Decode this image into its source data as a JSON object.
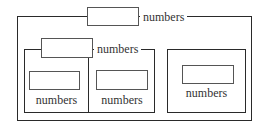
{
  "diagram": {
    "outer_group": {
      "label": "numbers"
    },
    "left_group": {
      "label": "numbers",
      "cells": [
        {
          "label": "numbers"
        },
        {
          "label": "numbers"
        }
      ]
    },
    "right_group": {
      "label": "numbers"
    }
  },
  "colors": {
    "border": "#2a2a2a",
    "box_border": "#555555",
    "text": "#333333",
    "background": "#ffffff"
  }
}
